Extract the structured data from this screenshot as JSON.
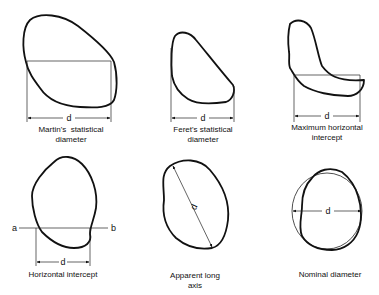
{
  "figure": {
    "panels": [
      {
        "id": "martin",
        "measure_label": "d",
        "caption_line1": "Martin's  statistical",
        "caption_line2": "diameter"
      },
      {
        "id": "feret",
        "measure_label": "d",
        "caption_line1": "Feret's  statistical",
        "caption_line2": "diameter"
      },
      {
        "id": "max-horizontal",
        "measure_label": "d",
        "caption_line1": "Maximum  horizontal",
        "caption_line2": "intercept"
      },
      {
        "id": "horizontal-intercept",
        "measure_label": "d",
        "line_start_label": "a",
        "line_end_label": "b",
        "caption_line1": "Horizontal  intercept"
      },
      {
        "id": "apparent-long-axis",
        "measure_label": "d",
        "caption_line1": "Apparent  long",
        "caption_line2": "axis"
      },
      {
        "id": "nominal",
        "measure_label": "d",
        "caption_line1": "Nominal  diameter"
      }
    ]
  }
}
